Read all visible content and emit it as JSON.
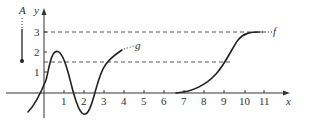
{
  "figure": {
    "type": "function-graph",
    "axes": {
      "x_label": "x",
      "y_label": "y",
      "x_ticks": [
        "1",
        "2",
        "3",
        "4",
        "5",
        "6",
        "7",
        "8",
        "9",
        "10",
        "11"
      ],
      "y_ticks": [
        "1",
        "2",
        "3"
      ]
    },
    "curves": [
      {
        "name": "g",
        "label": "g",
        "description": "oscillating curve, peak near (0.6,1.9), min near (1.9,-1.2), ends near (3.9,2.0)"
      },
      {
        "name": "f",
        "label": "f",
        "description": "sigmoid curve from (6.6,0) rising to horizontal asymptote y=3"
      }
    ],
    "dashed_lines": [
      {
        "y": 3,
        "x_end": 11
      },
      {
        "y": 1.5,
        "x_end": 9.4
      }
    ],
    "side_marker": {
      "label": "A"
    }
  },
  "colors": {
    "curve": "#222222",
    "axis": "#333333",
    "dashed": "#444444"
  }
}
